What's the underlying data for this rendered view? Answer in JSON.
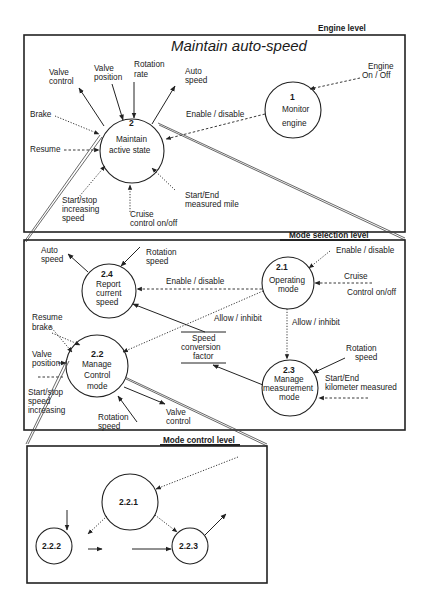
{
  "engine_level": {
    "level_label": "Engine level",
    "title": "Maintain auto-speed",
    "process_2": {
      "number": "2",
      "name_line1": "Maintain",
      "name_line2": "active state"
    },
    "process_1": {
      "number": "1",
      "name_line1": "Monitor",
      "name_line2": "engine"
    },
    "flows": {
      "valve_control": [
        "Valve",
        "control"
      ],
      "valve_position": [
        "Valve",
        "position"
      ],
      "rotation_rate": [
        "Rotation",
        "rate"
      ],
      "auto_speed": [
        "Auto",
        "speed"
      ],
      "engine_on_off": [
        "Engine",
        "On / Off"
      ],
      "brake": "Brake",
      "resume": "Resume",
      "enable_disable": "Enable / disable",
      "start_stop_increasing_speed": [
        "Start/stop",
        "increasing",
        "speed"
      ],
      "cruise_control": [
        "Cruise",
        "control on/off"
      ],
      "start_end_measured_mile": [
        "Start/End",
        "measured mile"
      ]
    }
  },
  "mode_selection_level": {
    "level_label": "Mode selection level",
    "process_2_1": {
      "number": "2.1",
      "name_line1": "Operating",
      "name_line2": "mode"
    },
    "process_2_2": {
      "number": "2.2",
      "name_line1": "Manage",
      "name_line2": "Control",
      "name_line3": "mode"
    },
    "process_2_3": {
      "number": "2.3",
      "name_line1": "Manage",
      "name_line2": "measurement",
      "name_line3": "mode"
    },
    "process_2_4": {
      "number": "2.4",
      "name_line1": "Report",
      "name_line2": "current",
      "name_line3": "speed"
    },
    "data_store": [
      "Speed",
      "conversion",
      "factor"
    ],
    "flows": {
      "auto_speed": [
        "Auto",
        "speed"
      ],
      "rotation_speed_2_4": [
        "Rotation",
        "speed"
      ],
      "enable_disable_in": "Enable / disable",
      "enable_disable_2_4": "Enable / disable",
      "cruise_control": [
        "Cruise",
        "Control on/off"
      ],
      "allow_inhibit_2_2": "Allow /  inhibit",
      "allow_inhibit_2_3": "Allow / inhibit",
      "resume_brake": [
        "Resume",
        "brake"
      ],
      "valve_position": [
        "Valve",
        "position"
      ],
      "start_stop_speed_increasing": [
        "Start/stop",
        "speed",
        "increasing"
      ],
      "rotation_speed_2_2": [
        "Rotation",
        "speed"
      ],
      "valve_control": [
        "Valve",
        "control"
      ],
      "rotation_speed_2_3": [
        "Rotation",
        "speed"
      ],
      "start_end_kilometer": [
        "Start/End",
        "kilometer  measured"
      ]
    }
  },
  "mode_control_level": {
    "level_label": "Mode control level",
    "process_2_2_1": {
      "number": "2.2.1"
    },
    "process_2_2_2": {
      "number": "2.2.2"
    },
    "process_2_2_3": {
      "number": "2.2.3"
    }
  }
}
